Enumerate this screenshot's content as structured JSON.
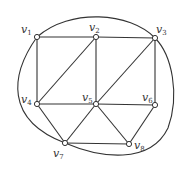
{
  "graph": {
    "vertices": [
      {
        "id": "v1",
        "label": "v",
        "sub": "1",
        "x": 37,
        "y": 37,
        "lx": 21,
        "ly": 33
      },
      {
        "id": "v2",
        "label": "v",
        "sub": "2",
        "x": 96,
        "y": 37,
        "lx": 89,
        "ly": 31
      },
      {
        "id": "v3",
        "label": "v",
        "sub": "3",
        "x": 155,
        "y": 38,
        "lx": 156,
        "ly": 33
      },
      {
        "id": "v4",
        "label": "v",
        "sub": "4",
        "x": 37,
        "y": 104,
        "lx": 21,
        "ly": 103
      },
      {
        "id": "v5",
        "label": "v",
        "sub": "5",
        "x": 96,
        "y": 104,
        "lx": 82,
        "ly": 101
      },
      {
        "id": "v6",
        "label": "v",
        "sub": "6",
        "x": 155,
        "y": 105,
        "lx": 142,
        "ly": 101
      },
      {
        "id": "v7",
        "label": "v",
        "sub": "7",
        "x": 65,
        "y": 143,
        "lx": 53,
        "ly": 157
      },
      {
        "id": "v8",
        "label": "v",
        "sub": "8",
        "x": 129,
        "y": 144,
        "lx": 134,
        "ly": 149
      }
    ],
    "edges": [
      [
        "v1",
        "v2"
      ],
      [
        "v2",
        "v3"
      ],
      [
        "v1",
        "v4"
      ],
      [
        "v2",
        "v4"
      ],
      [
        "v2",
        "v5"
      ],
      [
        "v3",
        "v5"
      ],
      [
        "v3",
        "v6"
      ],
      [
        "v4",
        "v5"
      ],
      [
        "v5",
        "v6"
      ],
      [
        "v4",
        "v7"
      ],
      [
        "v5",
        "v7"
      ],
      [
        "v5",
        "v8"
      ],
      [
        "v6",
        "v8"
      ],
      [
        "v7",
        "v8"
      ]
    ],
    "curves": [
      {
        "from": "v1",
        "to": "v3",
        "d": "M37,37 C70,8 130,12 155,38"
      },
      {
        "from": "v1",
        "to": "v7",
        "d": "M37,37 C10,75 5,120 65,143"
      },
      {
        "from": "v7",
        "to": "v3",
        "d": "M65,143 C100,158 150,165 168,128 C180,95 172,55 155,38"
      }
    ]
  }
}
